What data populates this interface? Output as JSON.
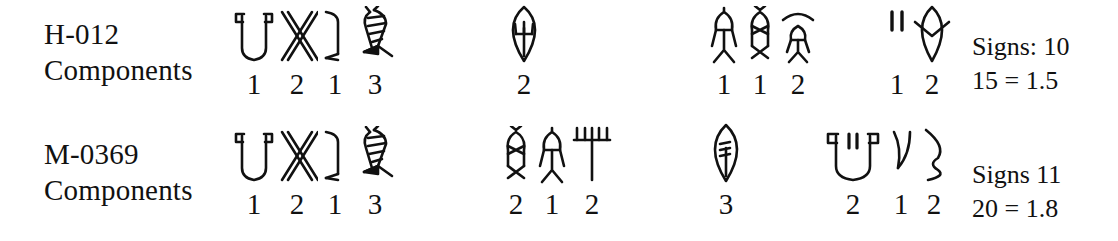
{
  "page": {
    "width": 1118,
    "height": 241,
    "background": "#ffffff",
    "ink": "#111111",
    "figure_type": "indus-script-sign-sequence-comparison"
  },
  "rows": [
    {
      "id_label": "H-012",
      "components_label": "Components",
      "groups": [
        {
          "name": "group-1",
          "left": 232,
          "glyphs": [
            {
              "icon": "jar-with-two-prongs-sign",
              "width": 44,
              "count": "1"
            },
            {
              "icon": "double-x-crossed-sign",
              "width": 42,
              "count": "2"
            },
            {
              "icon": "hooked-stroke-sign",
              "width": 34,
              "count": "1"
            },
            {
              "icon": "striped-fish-sign",
              "width": 46,
              "count": "3"
            }
          ]
        },
        {
          "name": "group-2",
          "left": 498,
          "glyphs": [
            {
              "icon": "leaf-oval-with-trident-sign",
              "width": 52,
              "count": "2"
            }
          ]
        },
        {
          "name": "group-3",
          "left": 706,
          "glyphs": [
            {
              "icon": "standing-person-sign",
              "width": 36,
              "count": "1"
            },
            {
              "icon": "double-person-sign",
              "width": 36,
              "count": "1"
            },
            {
              "icon": "person-under-chevron-sign",
              "width": 40,
              "count": "2"
            }
          ]
        },
        {
          "name": "group-4",
          "left": 884,
          "glyphs": [
            {
              "icon": "two-vertical-strokes-sign",
              "width": 26,
              "count": "1"
            },
            {
              "icon": "leaf-oval-with-notch-sign",
              "width": 44,
              "count": "2"
            }
          ]
        }
      ],
      "tally": {
        "left": 972,
        "top": 30,
        "signs_text": "Signs: 10",
        "ratio_text": "15 = 1.5"
      }
    },
    {
      "id_label": "M-0369",
      "components_label": "Components",
      "groups": [
        {
          "name": "group-1",
          "left": 232,
          "glyphs": [
            {
              "icon": "jar-with-two-prongs-sign",
              "width": 44,
              "count": "1"
            },
            {
              "icon": "double-x-crossed-sign",
              "width": 42,
              "count": "2"
            },
            {
              "icon": "hooked-stroke-sign",
              "width": 34,
              "count": "1"
            },
            {
              "icon": "striped-fish-sign",
              "width": 46,
              "count": "3"
            }
          ]
        },
        {
          "name": "group-2",
          "left": 498,
          "glyphs": [
            {
              "icon": "double-person-sign",
              "width": 36,
              "count": "2"
            },
            {
              "icon": "standing-person-sign",
              "width": 36,
              "count": "1"
            },
            {
              "icon": "rake-comb-sign",
              "width": 44,
              "count": "2"
            }
          ]
        },
        {
          "name": "group-3",
          "left": 700,
          "glyphs": [
            {
              "icon": "leaf-oval-with-stem-sign",
              "width": 52,
              "count": "3"
            }
          ]
        },
        {
          "name": "group-4",
          "left": 822,
          "glyphs": [
            {
              "icon": "jar-with-quotes-sign",
              "width": 62,
              "count": "2"
            },
            {
              "icon": "curved-stroke-sign",
              "width": 34,
              "count": "1"
            },
            {
              "icon": "open-hook-sign",
              "width": 32,
              "count": "2"
            }
          ]
        }
      ],
      "tally": {
        "left": 972,
        "top": 158,
        "signs_text": "Signs 11",
        "ratio_text": "20 = 1.8"
      }
    }
  ]
}
